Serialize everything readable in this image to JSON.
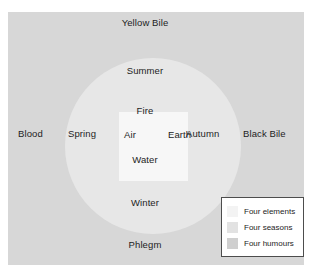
{
  "diagram": {
    "regions": {
      "humours": {
        "name": "Four humours",
        "color": "#d7d7d7"
      },
      "seasons": {
        "name": "Four seasons",
        "color": "#e7e7e7"
      },
      "elements": {
        "name": "Four elements",
        "color": "#f7f7f7"
      }
    },
    "humours": {
      "top": "Yellow Bile",
      "left": "Blood",
      "right": "Black Bile",
      "bottom": "Phlegm"
    },
    "seasons": {
      "top": "Summer",
      "left": "Spring",
      "right": "Autumn",
      "bottom": "Winter"
    },
    "elements": {
      "top": "Fire",
      "left": "Air",
      "right": "Earth",
      "bottom": "Water"
    }
  },
  "legend": {
    "items": [
      {
        "label": "Four elements",
        "color": "#f3f3f3"
      },
      {
        "label": "Four seasons",
        "color": "#e2e2e2"
      },
      {
        "label": "Four humours",
        "color": "#cfcfcf"
      }
    ]
  }
}
